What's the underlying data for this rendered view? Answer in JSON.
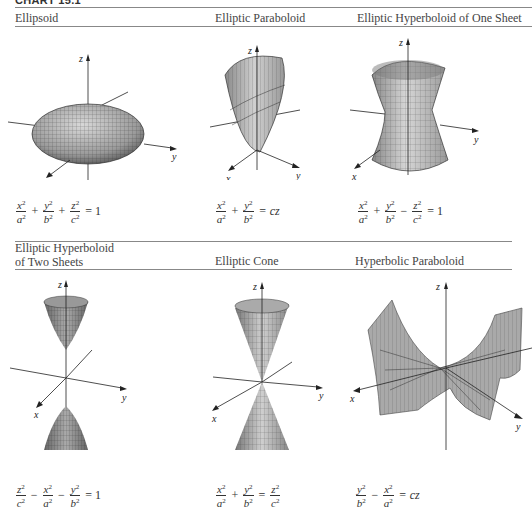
{
  "header": {
    "label": "CHART 15.1"
  },
  "panels": [
    {
      "title": "Ellipsoid",
      "equation": {
        "terms": [
          {
            "sign": "",
            "num": "x",
            "den": "a"
          },
          {
            "sign": "+",
            "num": "y",
            "den": "b"
          },
          {
            "sign": "+",
            "num": "z",
            "den": "c"
          }
        ],
        "rhs": "= 1"
      }
    },
    {
      "title": "Elliptic Paraboloid",
      "equation": {
        "terms": [
          {
            "sign": "",
            "num": "x",
            "den": "a"
          },
          {
            "sign": "+",
            "num": "y",
            "den": "b"
          }
        ],
        "rhs": "= cz"
      }
    },
    {
      "title": "Elliptic Hyperboloid of One Sheet",
      "equation": {
        "terms": [
          {
            "sign": "",
            "num": "x",
            "den": "a"
          },
          {
            "sign": "+",
            "num": "y",
            "den": "b"
          },
          {
            "sign": "−",
            "num": "z",
            "den": "c"
          }
        ],
        "rhs": "= 1"
      }
    },
    {
      "title_line1": "Elliptic Hyperboloid",
      "title_line2": "of Two Sheets",
      "equation": {
        "terms": [
          {
            "sign": "",
            "num": "z",
            "den": "c"
          },
          {
            "sign": "−",
            "num": "x",
            "den": "a"
          },
          {
            "sign": "−",
            "num": "y",
            "den": "b"
          }
        ],
        "rhs": "= 1"
      }
    },
    {
      "title": "Elliptic Cone",
      "equation": {
        "terms": [
          {
            "sign": "",
            "num": "x",
            "den": "a"
          },
          {
            "sign": "+",
            "num": "y",
            "den": "b"
          },
          {
            "sign": "=",
            "num": "z",
            "den": "c"
          }
        ],
        "rhs": ""
      }
    },
    {
      "title": "Hyperbolic Paraboloid",
      "equation": {
        "terms": [
          {
            "sign": "",
            "num": "y",
            "den": "b"
          },
          {
            "sign": "−",
            "num": "x",
            "den": "a"
          }
        ],
        "rhs": "= cz"
      }
    }
  ],
  "axis_labels": {
    "x": "x",
    "y": "y",
    "z": "z"
  },
  "sup": "2",
  "colors": {
    "surface_fill": "#b8b8b8",
    "surface_dark": "#6a6a6a",
    "mesh": "#333333",
    "axis": "#222222",
    "rule": "#888888"
  }
}
